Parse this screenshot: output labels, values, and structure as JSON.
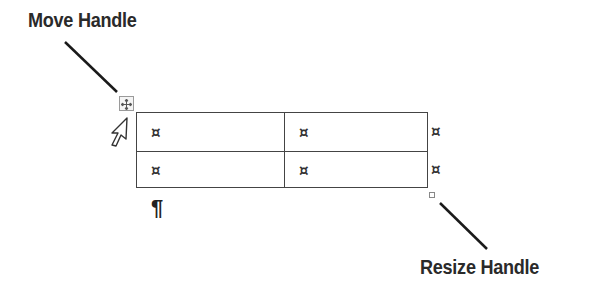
{
  "callouts": {
    "move_handle": "Move Handle",
    "resize_handle": "Resize Handle"
  },
  "table": {
    "rows": 2,
    "columns": 2,
    "cell_marks": [
      [
        "¤",
        "¤"
      ],
      [
        "¤",
        "¤"
      ]
    ],
    "end_of_row_marks": [
      "¤",
      "¤"
    ]
  },
  "paragraph_mark": "¶",
  "icons": {
    "move_handle": "move-arrows-icon",
    "resize_handle": "resize-square-icon",
    "cursor": "arrow-cursor-icon"
  }
}
